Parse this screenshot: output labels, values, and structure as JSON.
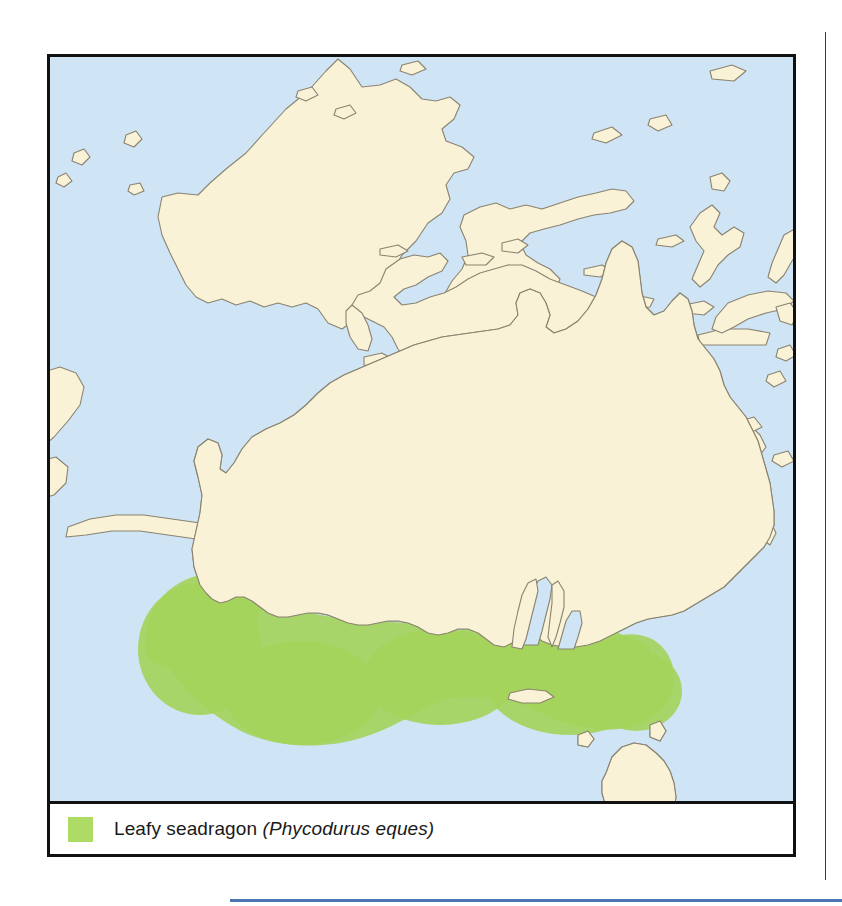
{
  "figure": {
    "type": "species-range-map",
    "region": "Australia and Southeast Asia / Oceania"
  },
  "legend": {
    "swatch_name": "range-color-swatch",
    "common_name": "Leafy seadragon",
    "scientific_name": "(Phycodurus eques)"
  },
  "colors": {
    "ocean": "#cfe4f5",
    "land": "#f9f2d6",
    "coastline": "#8a8370",
    "range": "#a5d45c",
    "legend_swatch": "#aedb63",
    "frame": "#111111",
    "column_rule": "#3a3a3a",
    "bottom_rule": "#4a77b4"
  },
  "map_content": {
    "range_description": "Shaded green coastal band along southern Australia, from the south-west corner of Western Australia east across the Great Australian Bight to the South Australian gulfs and western Victoria.",
    "landmasses": [
      "Australia",
      "New Guinea",
      "Borneo",
      "Sulawesi",
      "Java",
      "Lesser Sunda Islands",
      "Tasmania",
      "New Britain",
      "Solomon Islands"
    ]
  }
}
